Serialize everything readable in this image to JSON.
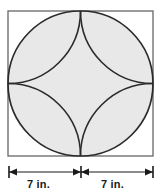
{
  "figure": {
    "shape_names": {
      "square": "square-outline",
      "circle": "inscribed-circle",
      "star": "four-pointed-star-region",
      "corner_arcs": "corner-quarter-arcs"
    },
    "colors": {
      "fill_gray": "#e8e8e8",
      "stroke_dark": "#2b2b2b",
      "stroke_square": "#555555",
      "star_fill": "#ffffff",
      "background": "#ffffff",
      "text": "#1a1a1a"
    },
    "geometry": {
      "square_left": 8,
      "square_top": 11,
      "square_side": 145,
      "circle_center_x": 80.5,
      "circle_center_y": 83.5,
      "circle_radius": 72.5,
      "corner_arc_radius": 72.5
    }
  },
  "dimensions": {
    "left_label": "7 in.",
    "right_label": "7 in.",
    "line_y": 172,
    "left_tick_x": 9,
    "center_tick_x": 81,
    "right_tick_x": 153
  }
}
